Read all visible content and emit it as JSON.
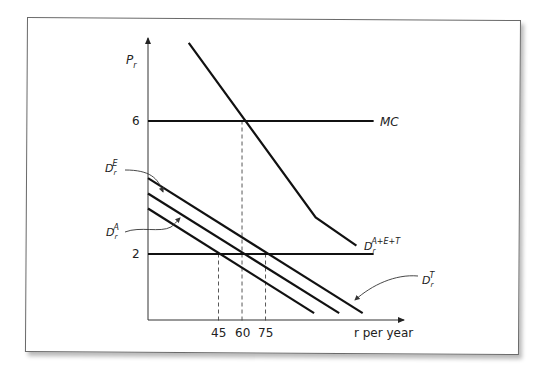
{
  "chart_data": {
    "type": "line",
    "title": "",
    "xlabel": "r per year",
    "ylabel": "P_r",
    "xlim": [
      0,
      162
    ],
    "ylim": [
      0,
      8.8
    ],
    "x_ticks": [
      45,
      60,
      75
    ],
    "y_ticks": [
      2,
      6
    ],
    "grid": false,
    "series": [
      {
        "name": "MC",
        "label_main": "MC",
        "label_sup": "",
        "style": "solid",
        "points": [
          [
            0,
            6
          ],
          [
            144,
            6
          ]
        ]
      },
      {
        "name": "P=2 price line",
        "label_main": "",
        "label_sup": "",
        "style": "solid",
        "points": [
          [
            0,
            2
          ],
          [
            144,
            2
          ]
        ]
      },
      {
        "name": "D_r^A",
        "label_main": "D",
        "label_sub": "r",
        "label_sup": "A",
        "style": "solid",
        "points": [
          [
            0,
            3.37
          ],
          [
            106,
            0.22
          ]
        ]
      },
      {
        "name": "D_r^E",
        "label_main": "D",
        "label_sub": "r",
        "label_sup": "E",
        "style": "solid",
        "points": [
          [
            0,
            3.82
          ],
          [
            122,
            0.22
          ]
        ]
      },
      {
        "name": "D_r^T",
        "label_main": "D",
        "label_sub": "r",
        "label_sup": "T",
        "style": "solid",
        "points": [
          [
            0,
            4.28
          ],
          [
            137,
            0.22
          ]
        ]
      },
      {
        "name": "D_r^A+E+T",
        "label_main": "D",
        "label_sub": "r",
        "label_sup": "A+E+T",
        "style": "solid",
        "points": [
          [
            26,
            8.35
          ],
          [
            107,
            3.1
          ],
          [
            133,
            2.25
          ]
        ]
      }
    ],
    "reference_lines": [
      {
        "x": 45,
        "from_y": 0,
        "to_y": 2,
        "style": "dashed"
      },
      {
        "x": 60,
        "from_y": 0,
        "to_y": 6,
        "style": "dashed"
      },
      {
        "x": 75,
        "from_y": 0,
        "to_y": 2,
        "style": "dashed"
      }
    ],
    "annotations": [
      {
        "text": "D_r^E",
        "points_to": "D_r^E"
      },
      {
        "text": "D_r^A",
        "points_to": "D_r^A"
      },
      {
        "text": "D_r^T",
        "points_to": "D_r^T"
      }
    ]
  },
  "labels": {
    "y_axis_main": "P",
    "y_axis_sub": "r",
    "x_axis": "r per year",
    "tick_45": "45",
    "tick_60": "60",
    "tick_75": "75",
    "tick_2": "2",
    "tick_6": "6",
    "mc": "MC",
    "d": "D",
    "r": "r",
    "sup_A": "A",
    "sup_E": "E",
    "sup_T": "T",
    "sup_AET": "A+E+T"
  }
}
